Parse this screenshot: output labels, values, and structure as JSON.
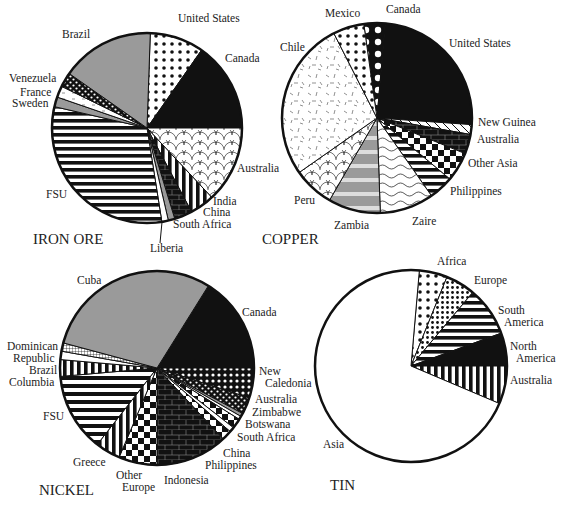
{
  "chart_data": [
    {
      "type": "pie",
      "title": "IRON ORE",
      "center": [
        147,
        128
      ],
      "radius": 95,
      "title_pos": [
        33,
        244
      ],
      "slices": [
        {
          "label": "United States",
          "start": 2,
          "end": 35,
          "pattern": "dots-white",
          "label_pos": [
            178,
            22
          ],
          "anchor": "start"
        },
        {
          "label": "Canada",
          "start": 35,
          "end": 90,
          "pattern": "black",
          "label_pos": [
            225,
            62
          ],
          "anchor": "start"
        },
        {
          "label": "Australia",
          "start": 90,
          "end": 137,
          "pattern": "scales",
          "label_pos": [
            237,
            172
          ],
          "anchor": "start"
        },
        {
          "label": "India",
          "start": 137,
          "end": 152,
          "pattern": "vstripes",
          "label_pos": [
            213,
            205
          ],
          "anchor": "start"
        },
        {
          "label": "China",
          "start": 152,
          "end": 163,
          "pattern": "bricks",
          "label_pos": [
            203,
            216
          ],
          "anchor": "start"
        },
        {
          "label": "South Africa",
          "start": 163,
          "end": 167,
          "pattern": "gray",
          "label_pos": [
            173,
            228
          ],
          "anchor": "start"
        },
        {
          "label": "Liberia",
          "start": 167,
          "end": 171,
          "pattern": "white",
          "label_pos": [
            150,
            252
          ],
          "anchor": "start"
        },
        {
          "label": "FSU",
          "start": 171,
          "end": 283,
          "pattern": "hstripes",
          "label_pos": [
            46,
            198
          ],
          "anchor": "start"
        },
        {
          "label": "Sweden",
          "start": 283,
          "end": 289,
          "pattern": "gray",
          "label_pos": [
            12,
            107
          ],
          "anchor": "start"
        },
        {
          "label": "France",
          "start": 289,
          "end": 296,
          "pattern": "white-dash",
          "label_pos": [
            20,
            96
          ],
          "anchor": "start"
        },
        {
          "label": "Venezuela",
          "start": 296,
          "end": 305,
          "pattern": "checker-dots",
          "label_pos": [
            9,
            82
          ],
          "anchor": "start"
        },
        {
          "label": "Brazil",
          "start": 305,
          "end": 362,
          "pattern": "gray",
          "label_pos": [
            62,
            38
          ],
          "anchor": "start"
        }
      ]
    },
    {
      "type": "pie",
      "title": "COPPER",
      "center": [
        377,
        118
      ],
      "radius": 95,
      "title_pos": [
        262,
        244
      ],
      "slices": [
        {
          "label": "Canada",
          "start": -8,
          "end": 5,
          "pattern": "big-dots-black",
          "label_pos": [
            386,
            13
          ],
          "anchor": "start"
        },
        {
          "label": "United States",
          "start": 5,
          "end": 94,
          "pattern": "black",
          "label_pos": [
            449,
            47
          ],
          "anchor": "start"
        },
        {
          "label": "New Guinea",
          "start": 94,
          "end": 100,
          "pattern": "diag",
          "label_pos": [
            478,
            126
          ],
          "anchor": "start"
        },
        {
          "label": "Australia",
          "start": 100,
          "end": 112,
          "pattern": "bricks",
          "label_pos": [
            477,
            143
          ],
          "anchor": "start"
        },
        {
          "label": "Other Asia",
          "start": 112,
          "end": 130,
          "pattern": "checker",
          "label_pos": [
            468,
            167
          ],
          "anchor": "start"
        },
        {
          "label": "Philippines",
          "start": 130,
          "end": 145,
          "pattern": "hstripes",
          "label_pos": [
            450,
            195
          ],
          "anchor": "start"
        },
        {
          "label": "Zaire",
          "start": 145,
          "end": 178,
          "pattern": "waves",
          "label_pos": [
            412,
            225
          ],
          "anchor": "start"
        },
        {
          "label": "Zambia",
          "start": 178,
          "end": 210,
          "pattern": "gray-bands",
          "label_pos": [
            334,
            229
          ],
          "anchor": "start"
        },
        {
          "label": "Peru",
          "start": 210,
          "end": 235,
          "pattern": "scales",
          "label_pos": [
            294,
            204
          ],
          "anchor": "start"
        },
        {
          "label": "Chile",
          "start": 235,
          "end": 333,
          "pattern": "dashes",
          "label_pos": [
            280,
            51
          ],
          "anchor": "start"
        },
        {
          "label": "Mexico",
          "start": 333,
          "end": 352,
          "pattern": "dots-white",
          "label_pos": [
            325,
            17
          ],
          "anchor": "start"
        }
      ]
    },
    {
      "type": "pie",
      "title": "NICKEL",
      "center": [
        157,
        368
      ],
      "radius": 97,
      "title_pos": [
        39,
        495
      ],
      "slices": [
        {
          "label": "Canada",
          "start": 32,
          "end": 90,
          "pattern": "black",
          "label_pos": [
            242,
            316
          ],
          "anchor": "start"
        },
        {
          "label": "New Caledonia",
          "start": 90,
          "end": 108,
          "pattern": "dots-grad",
          "label_pos": [
            259,
            375
          ],
          "anchor": "start",
          "label_lines": [
            "New",
            "Caledonia"
          ]
        },
        {
          "label": "Australia",
          "start": 108,
          "end": 118,
          "pattern": "checker-dots",
          "label_pos": [
            255,
            403
          ],
          "anchor": "start"
        },
        {
          "label": "Zimbabwe",
          "start": 118,
          "end": 120,
          "pattern": "gray",
          "label_pos": [
            252,
            416
          ],
          "anchor": "start"
        },
        {
          "label": "Botswana",
          "start": 120,
          "end": 122,
          "pattern": "white",
          "label_pos": [
            245,
            428
          ],
          "anchor": "start"
        },
        {
          "label": "South Africa",
          "start": 122,
          "end": 128,
          "pattern": "checker",
          "label_pos": [
            237,
            441
          ],
          "anchor": "start"
        },
        {
          "label": "China",
          "start": 128,
          "end": 131,
          "pattern": "white",
          "label_pos": [
            223,
            457
          ],
          "anchor": "start"
        },
        {
          "label": "Philippines",
          "start": 131,
          "end": 137,
          "pattern": "checker",
          "label_pos": [
            205,
            469
          ],
          "anchor": "start"
        },
        {
          "label": "Indonesia",
          "start": 137,
          "end": 180,
          "pattern": "bricks",
          "label_pos": [
            164,
            484
          ],
          "anchor": "start"
        },
        {
          "label": "Other Europe",
          "start": 180,
          "end": 203,
          "pattern": "checker",
          "label_pos": [
            116,
            479
          ],
          "anchor": "start",
          "label_lines": [
            "Other",
            "Europe"
          ]
        },
        {
          "label": "Greece",
          "start": 203,
          "end": 218,
          "pattern": "vstripes",
          "label_pos": [
            73,
            466
          ],
          "anchor": "start"
        },
        {
          "label": "FSU",
          "start": 218,
          "end": 265,
          "pattern": "chevron",
          "label_pos": [
            43,
            420
          ],
          "anchor": "start"
        },
        {
          "label": "Columbia",
          "start": 265,
          "end": 275,
          "pattern": "vstripes",
          "label_pos": [
            9,
            386
          ],
          "anchor": "start"
        },
        {
          "label": "Brazil",
          "start": 275,
          "end": 280,
          "pattern": "white",
          "label_pos": [
            29,
            374
          ],
          "anchor": "start"
        },
        {
          "label": "Dominican Republic",
          "start": 280,
          "end": 285,
          "pattern": "crosshatch",
          "label_pos": [
            7,
            350
          ],
          "anchor": "start",
          "label_lines": [
            "Dominican",
            "Republic"
          ]
        },
        {
          "label": "Cuba",
          "start": 285,
          "end": 392,
          "pattern": "gray",
          "label_pos": [
            77,
            284
          ],
          "anchor": "start"
        }
      ]
    },
    {
      "type": "pie",
      "title": "TIN",
      "center": [
        411,
        366
      ],
      "radius": 96,
      "title_pos": [
        330,
        490
      ],
      "slices": [
        {
          "label": "Africa",
          "start": 5,
          "end": 22,
          "pattern": "dots-white",
          "label_pos": [
            437,
            265
          ],
          "anchor": "start"
        },
        {
          "label": "Europe",
          "start": 22,
          "end": 40,
          "pattern": "dots-dense",
          "label_pos": [
            474,
            284
          ],
          "anchor": "start"
        },
        {
          "label": "South America",
          "start": 40,
          "end": 70,
          "pattern": "hstripes",
          "label_pos": [
            498,
            314
          ],
          "anchor": "start",
          "label_lines": [
            "South",
            "America"
          ]
        },
        {
          "label": "North America",
          "start": 70,
          "end": 90,
          "pattern": "black",
          "label_pos": [
            510,
            350
          ],
          "anchor": "start",
          "label_lines": [
            "North",
            "America"
          ]
        },
        {
          "label": "Australia",
          "start": 90,
          "end": 113,
          "pattern": "vstripes",
          "label_pos": [
            510,
            384
          ],
          "anchor": "start"
        },
        {
          "label": "Asia",
          "start": 113,
          "end": 365,
          "pattern": "white",
          "label_pos": [
            323,
            448
          ],
          "anchor": "start"
        }
      ]
    }
  ],
  "titles": {
    "iron_ore": "IRON ORE",
    "copper": "COPPER",
    "nickel": "NICKEL",
    "tin": "TIN"
  }
}
